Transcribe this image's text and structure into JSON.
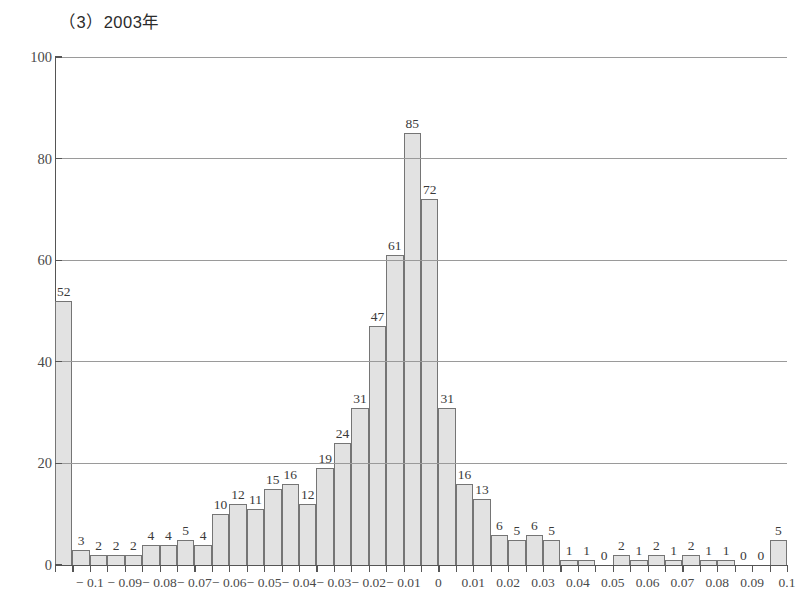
{
  "chart_data": {
    "type": "bar",
    "title": "（3）2003年",
    "xlabel": "",
    "ylabel": "",
    "ylim": [
      0,
      100
    ],
    "yticks": [
      "0",
      "20",
      "40",
      "60",
      "80",
      "100"
    ],
    "grid": "horizontal",
    "legend": "none",
    "xtick_labels": [
      "− 0.1",
      "− 0.09",
      "− 0.08",
      "− 0.07",
      "− 0.06",
      "− 0.05",
      "− 0.04",
      "− 0.03",
      "− 0.02",
      "− 0.01",
      "0",
      "0.01",
      "0.02",
      "0.03",
      "0.04",
      "0.05",
      "0.06",
      "0.07",
      "0.08",
      "0.09",
      "0.1"
    ],
    "bar_fill_color": "#e2e2e2",
    "bar_border_color": "#757575",
    "values": [
      52,
      3,
      2,
      2,
      2,
      4,
      4,
      5,
      4,
      10,
      12,
      11,
      15,
      16,
      12,
      19,
      24,
      31,
      47,
      61,
      85,
      72,
      31,
      16,
      13,
      6,
      5,
      6,
      5,
      1,
      1,
      0,
      2,
      1,
      2,
      1,
      2,
      1,
      1,
      0,
      0,
      5
    ],
    "value_labels": [
      "52",
      "3",
      "2",
      "2",
      "2",
      "4",
      "4",
      "5",
      "4",
      "10",
      "12",
      "11",
      "15",
      "16",
      "12",
      "19",
      "24",
      "31",
      "47",
      "61",
      "85",
      "72",
      "31",
      "16",
      "13",
      "6",
      "5",
      "6",
      "5",
      "1",
      "1",
      "0",
      "2",
      "1",
      "2",
      "1",
      "2",
      "1",
      "1",
      "0",
      "0",
      "5"
    ]
  }
}
